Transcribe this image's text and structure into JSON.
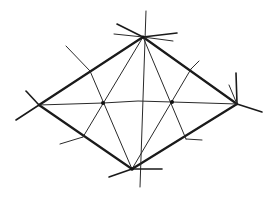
{
  "diagram": {
    "type": "rhombus-line-construction",
    "stroke_color": "#1a1a1a",
    "background": "#ffffff",
    "vertices": {
      "top": [
        143,
        37
      ],
      "left": [
        39,
        105
      ],
      "right": [
        237,
        104
      ],
      "bottom": [
        132,
        169
      ]
    },
    "interior_nodes": [
      {
        "name": "left-node",
        "pos": [
          103,
          103
        ]
      },
      {
        "name": "right-node",
        "pos": [
          172,
          102
        ]
      }
    ],
    "center_crossing": [
      138,
      101
    ],
    "edge_ticks": [
      {
        "name": "upper-left",
        "from": [
          66,
          46
        ],
        "to": [
          111,
          120
        ]
      },
      {
        "name": "upper-right",
        "from": [
          199,
          61
        ],
        "to": [
          160,
          129
        ]
      },
      {
        "name": "lower-left",
        "from": [
          60,
          144
        ],
        "to": [
          120,
          90
        ]
      },
      {
        "name": "lower-right",
        "from": [
          202,
          140
        ],
        "to": [
          160,
          84
        ]
      }
    ]
  }
}
